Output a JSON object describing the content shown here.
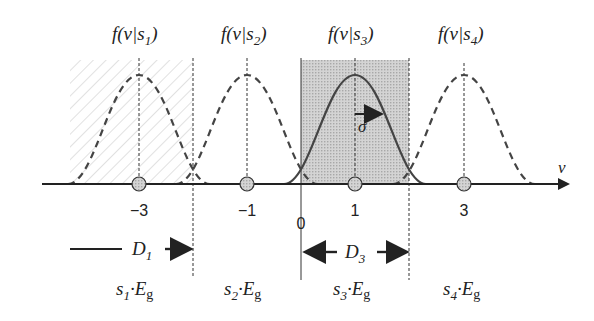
{
  "diagram": {
    "axis": {
      "label": "v",
      "ticks": [
        "−3",
        "−1",
        "1",
        "3"
      ],
      "zero_label": "0"
    },
    "pdf_labels": [
      {
        "f": "f(v|s",
        "sub": "1",
        "close": ")"
      },
      {
        "f": "f(v|s",
        "sub": "2",
        "close": ")"
      },
      {
        "f": "f(v|s",
        "sub": "3",
        "close": ")"
      },
      {
        "f": "f(v|s",
        "sub": "4",
        "close": ")"
      }
    ],
    "sigma_label": "σ",
    "regions": [
      {
        "label": "D",
        "sub": "1",
        "fill": "hatched"
      },
      {
        "label": "D",
        "sub": "3",
        "fill": "dotted-gray"
      }
    ],
    "energy_labels": [
      {
        "s": "s",
        "sub": "1",
        "dot": "·E",
        "g": "g"
      },
      {
        "s": "s",
        "sub": "2",
        "dot": "·E",
        "g": "g"
      },
      {
        "s": "s",
        "sub": "3",
        "dot": "·E",
        "g": "g"
      },
      {
        "s": "s",
        "sub": "4",
        "dot": "·E",
        "g": "g"
      }
    ],
    "colors": {
      "line": "#333333",
      "shade": "#c8c8c8",
      "hatch": "#bdbdbd",
      "marker": "#a9a9a9"
    }
  }
}
